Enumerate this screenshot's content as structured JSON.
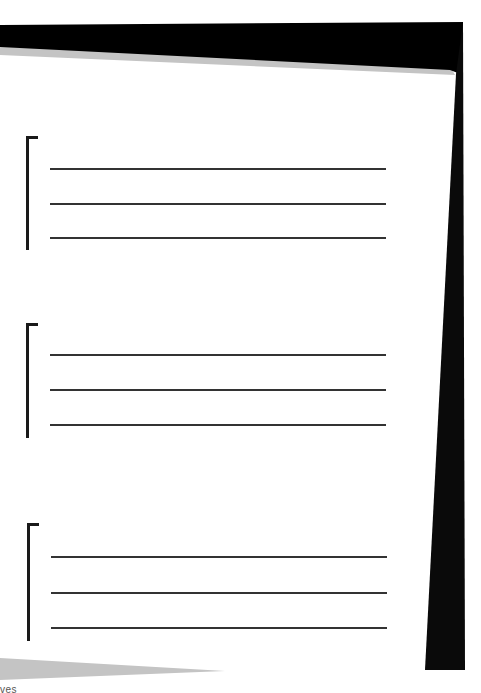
{
  "page": {
    "background": "#ffffff",
    "frame_color": "#000000",
    "shadow_color": "#c4c4c4"
  },
  "groups": [
    {
      "id": "group-1",
      "lines": 3
    },
    {
      "id": "group-2",
      "lines": 3
    },
    {
      "id": "group-3",
      "lines": 3
    }
  ],
  "footer": {
    "cut_text": "ves"
  }
}
